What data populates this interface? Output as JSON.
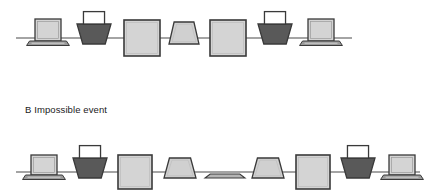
{
  "figure": {
    "caption": "B Impossible event",
    "caption_label": "B",
    "caption_title": "Impossible event",
    "background_color": "#ffffff",
    "line_color": "#4a4a4a",
    "outline_color": "#3a3a3a",
    "fill_light": "#d4d4d4",
    "fill_mid": "#c8c8c8",
    "fill_dark": "#595959",
    "fill_base": "#9a9a9a",
    "rows": [
      {
        "id": "row-top",
        "name": "top-sequence",
        "baseline_y": 38,
        "line_start_x": 16,
        "line_end_x": 352,
        "items": [
          {
            "index": 0,
            "kind": "laptop",
            "label": "laptop-open",
            "center_x": 48,
            "width": 26,
            "height": 22,
            "fill": "#d4d4d4"
          },
          {
            "index": 1,
            "kind": "basket",
            "label": "basket-dark",
            "center_x": 94,
            "width": 34,
            "height": 20,
            "fill": "#595959"
          },
          {
            "index": 2,
            "kind": "square",
            "label": "square-large",
            "center_x": 142,
            "width": 36,
            "height": 36,
            "fill": "#d4d4d4"
          },
          {
            "index": 3,
            "kind": "trapezoid",
            "label": "trapezoid-light",
            "center_x": 184,
            "width": 30,
            "height": 22,
            "fill": "#d0d0d0"
          },
          {
            "index": 4,
            "kind": "square",
            "label": "square-large",
            "center_x": 228,
            "width": 36,
            "height": 36,
            "fill": "#d4d4d4"
          },
          {
            "index": 5,
            "kind": "basket",
            "label": "basket-dark",
            "center_x": 275,
            "width": 34,
            "height": 20,
            "fill": "#595959"
          },
          {
            "index": 6,
            "kind": "laptop",
            "label": "laptop-open",
            "center_x": 321,
            "width": 26,
            "height": 22,
            "fill": "#d4d4d4"
          }
        ]
      },
      {
        "id": "row-bottom",
        "name": "bottom-sequence",
        "baseline_y": 172,
        "line_start_x": 16,
        "line_end_x": 420,
        "items": [
          {
            "index": 0,
            "kind": "laptop",
            "label": "laptop-open",
            "center_x": 44,
            "width": 26,
            "height": 20,
            "fill": "#d4d4d4"
          },
          {
            "index": 1,
            "kind": "basket",
            "label": "basket-dark",
            "center_x": 90,
            "width": 34,
            "height": 20,
            "fill": "#595959"
          },
          {
            "index": 2,
            "kind": "square",
            "label": "square-large",
            "center_x": 135,
            "width": 34,
            "height": 34,
            "fill": "#d4d4d4"
          },
          {
            "index": 3,
            "kind": "trapezoid",
            "label": "trapezoid-light",
            "center_x": 180,
            "width": 32,
            "height": 20,
            "fill": "#d0d0d0"
          },
          {
            "index": 4,
            "kind": "flat",
            "label": "trapezoid-flattened",
            "center_x": 225,
            "width": 40,
            "height": 4,
            "fill": "#b5b5b5"
          },
          {
            "index": 5,
            "kind": "trapezoid",
            "label": "trapezoid-light",
            "center_x": 268,
            "width": 32,
            "height": 20,
            "fill": "#d0d0d0"
          },
          {
            "index": 6,
            "kind": "square",
            "label": "square-large",
            "center_x": 313,
            "width": 34,
            "height": 34,
            "fill": "#d4d4d4"
          },
          {
            "index": 7,
            "kind": "basket",
            "label": "basket-dark",
            "center_x": 358,
            "width": 34,
            "height": 20,
            "fill": "#595959"
          },
          {
            "index": 8,
            "kind": "laptop",
            "label": "laptop-open",
            "center_x": 402,
            "width": 26,
            "height": 20,
            "fill": "#d4d4d4"
          }
        ]
      }
    ]
  }
}
